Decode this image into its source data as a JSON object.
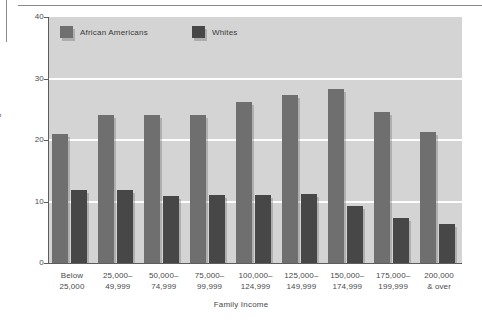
{
  "chart_data": {
    "type": "bar",
    "title": "",
    "xlabel": "Family Income",
    "ylabel": "Percentage",
    "ylim": [
      0,
      40
    ],
    "yticks": [
      0,
      10,
      20,
      30,
      40
    ],
    "grid": true,
    "legend_position": "top-left",
    "categories": [
      [
        "Below",
        "25,000"
      ],
      [
        "25,000–",
        "49,999"
      ],
      [
        "50,000–",
        "74,999"
      ],
      [
        "75,000–",
        "99,999"
      ],
      [
        "100,000–",
        "124,999"
      ],
      [
        "125,000–",
        "149,999"
      ],
      [
        "150,000–",
        "174,999"
      ],
      [
        "175,000–",
        "199,999"
      ],
      [
        "200,000",
        "& over"
      ]
    ],
    "series": [
      {
        "name": "African Americans",
        "color": "#6f6f6f",
        "values": [
          21.0,
          24.0,
          24.0,
          24.1,
          26.2,
          27.3,
          28.3,
          24.5,
          21.3
        ]
      },
      {
        "name": "Whites",
        "color": "#474747",
        "values": [
          11.9,
          11.9,
          10.9,
          11.0,
          11.1,
          11.2,
          9.3,
          7.3,
          6.3
        ]
      }
    ]
  },
  "axes": {
    "y_tick_labels": [
      "40",
      "30",
      "20",
      "10",
      "0"
    ],
    "y_axis_title": "Percentage",
    "x_axis_title": "Family Income"
  },
  "legend": {
    "items": [
      {
        "label": "African Americans",
        "swatch": "aa"
      },
      {
        "label": "Whites",
        "swatch": "wh"
      }
    ]
  },
  "colors": {
    "plot_background": "#d4d4d4",
    "gridline": "#fdfdfd",
    "axis": "#5d5d5d",
    "series_african_americans": "#6f6f6f",
    "series_whites": "#474747",
    "page_rule": "#8a8a8a"
  }
}
